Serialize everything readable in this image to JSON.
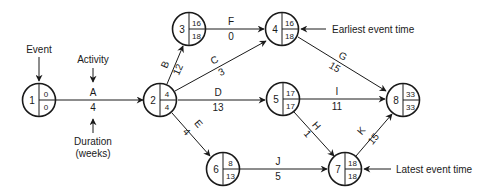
{
  "annotations": {
    "event": "Event",
    "activity": "Activity",
    "duration_line1": "Duration",
    "duration_line2": "(weeks)",
    "earliest": "Earliest event time",
    "latest": "Latest event time"
  },
  "nodes": [
    {
      "id": "1",
      "earliest": "0",
      "latest": "0"
    },
    {
      "id": "2",
      "earliest": "4",
      "latest": "4"
    },
    {
      "id": "3",
      "earliest": "16",
      "latest": "18"
    },
    {
      "id": "4",
      "earliest": "16",
      "latest": "18"
    },
    {
      "id": "5",
      "earliest": "17",
      "latest": "17"
    },
    {
      "id": "6",
      "earliest": "8",
      "latest": "13"
    },
    {
      "id": "7",
      "earliest": "18",
      "latest": "18"
    },
    {
      "id": "8",
      "earliest": "33",
      "latest": "33"
    }
  ],
  "activities": [
    {
      "name": "A",
      "duration": "4",
      "from": "1",
      "to": "2"
    },
    {
      "name": "B",
      "duration": "12",
      "from": "2",
      "to": "3"
    },
    {
      "name": "C",
      "duration": "3",
      "from": "2",
      "to": "4"
    },
    {
      "name": "D",
      "duration": "13",
      "from": "2",
      "to": "5"
    },
    {
      "name": "E",
      "duration": "4",
      "from": "2",
      "to": "6"
    },
    {
      "name": "F",
      "duration": "0",
      "from": "3",
      "to": "4"
    },
    {
      "name": "G",
      "duration": "15",
      "from": "4",
      "to": "8"
    },
    {
      "name": "I",
      "duration": "11",
      "from": "5",
      "to": "8"
    },
    {
      "name": "H",
      "duration": "1",
      "from": "5",
      "to": "7"
    },
    {
      "name": "J",
      "duration": "5",
      "from": "6",
      "to": "7"
    },
    {
      "name": "K",
      "duration": "15",
      "from": "7",
      "to": "8"
    }
  ]
}
